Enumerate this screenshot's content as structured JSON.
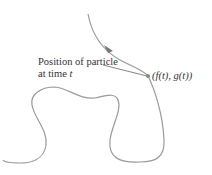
{
  "diagram": {
    "label_line1": "Position of particle",
    "label_line2_prefix": "at time ",
    "label_line2_var": "t",
    "point_label": "(f(t), g(t))",
    "curve_color": "#9a9a9a",
    "arrow_color": "#777777"
  }
}
